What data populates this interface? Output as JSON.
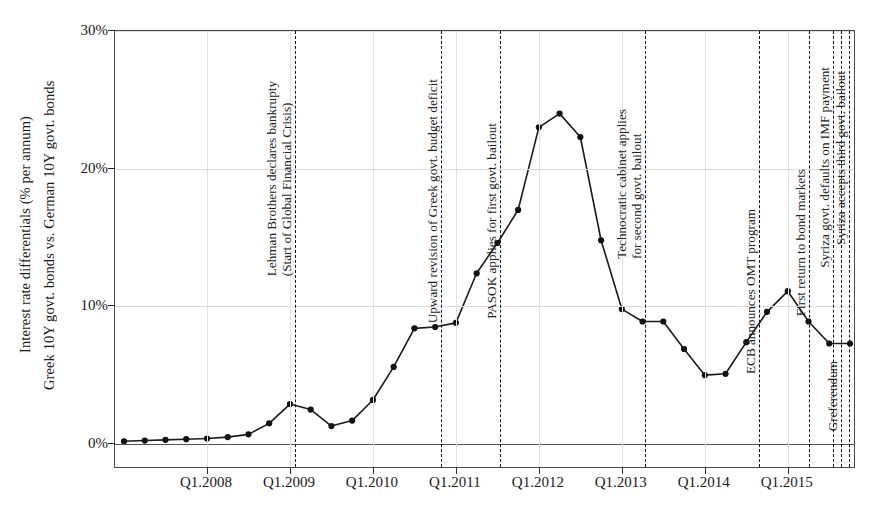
{
  "axis": {
    "y_title_line1": "Interest rate differentials (% per annum)",
    "y_title_line2": "Greek 10Y govt. bonds vs. German 10Y govt. bonds",
    "y_ticks": [
      "0%",
      "10%",
      "20%",
      "30%"
    ],
    "x_ticks": [
      "Q1.2008",
      "Q1.2009",
      "Q1.2010",
      "Q1.2011",
      "Q1.2012",
      "Q1.2013",
      "Q1.2014",
      "Q1.2015"
    ]
  },
  "events": [
    {
      "id": "lehman",
      "label_line1": "Lehman Brothers declares bankrupty",
      "label_line2": "(Start of Global Financial Crisis)",
      "x_pct": 24.3
    },
    {
      "id": "deficit",
      "label_line1": "Upward revision of Greek govt. budget deficit",
      "label_line2": "",
      "x_pct": 44.0
    },
    {
      "id": "pasok",
      "label_line1": "PASOK applies for first govt. bailout",
      "label_line2": "",
      "x_pct": 52.0
    },
    {
      "id": "technocratic",
      "label_line1": "Technocratic cabinet applies",
      "label_line2": "for second govt. bailout",
      "x_pct": 71.5
    },
    {
      "id": "omt",
      "label_line1": "ECB announces OMT program",
      "label_line2": "",
      "x_pct": 86.9
    },
    {
      "id": "bondmarkets",
      "label_line1": "First return to bond markets",
      "label_line2": "",
      "x_pct": 93.7
    },
    {
      "id": "imfdefault",
      "label_line1": "Syriza govt. defaults on IMF payment",
      "label_line2": "",
      "x_pct": 96.9
    },
    {
      "id": "greferendum",
      "label_line1": "Greferendum",
      "label_line2": "",
      "x_pct": 98.0
    },
    {
      "id": "thirdbailout",
      "label_line1": "Syriza accepts third govt. bailout",
      "label_line2": "",
      "x_pct": 99.0
    }
  ],
  "colors": {
    "line": "#1a1a1a",
    "marker": "#111111",
    "grid": "#dcdcdc",
    "frame": "#4a4a4a",
    "event_line": "#111111"
  },
  "chart_data": {
    "type": "line",
    "title": "",
    "xlabel": "",
    "ylabel": "Interest rate differentials (% per annum) Greek 10Y govt. bonds vs. German 10Y govt. bonds",
    "ylim": [
      0,
      30
    ],
    "ytick_values": [
      0,
      10,
      20,
      30
    ],
    "grid": true,
    "legend": "none",
    "x": [
      "Q1.2007",
      "Q2.2007",
      "Q3.2007",
      "Q4.2007",
      "Q1.2008",
      "Q2.2008",
      "Q3.2008",
      "Q4.2008",
      "Q1.2009",
      "Q2.2009",
      "Q3.2009",
      "Q4.2009",
      "Q1.2010",
      "Q2.2010",
      "Q3.2010",
      "Q4.2010",
      "Q1.2011",
      "Q2.2011",
      "Q3.2011",
      "Q4.2011",
      "Q1.2012",
      "Q2.2012",
      "Q3.2012",
      "Q4.2012",
      "Q1.2013",
      "Q2.2013",
      "Q3.2013",
      "Q4.2013",
      "Q1.2014",
      "Q2.2014",
      "Q3.2014",
      "Q4.2014",
      "Q1.2015",
      "Q2.2015",
      "Q3.2015",
      "Q4.2015"
    ],
    "values": [
      0.2,
      0.25,
      0.3,
      0.35,
      0.4,
      0.5,
      0.7,
      1.5,
      2.9,
      2.5,
      1.3,
      1.7,
      3.2,
      5.6,
      8.4,
      8.5,
      8.8,
      12.4,
      14.6,
      17.0,
      23.0,
      24.0,
      22.3,
      14.8,
      9.8,
      8.9,
      8.9,
      6.9,
      5.0,
      5.1,
      7.4,
      9.6,
      11.1,
      8.9,
      7.3,
      7.3
    ],
    "series": [
      {
        "name": "Greek 10Y vs German 10Y spread",
        "values": [
          0.2,
          0.25,
          0.3,
          0.35,
          0.4,
          0.5,
          0.7,
          1.5,
          2.9,
          2.5,
          1.3,
          1.7,
          3.2,
          5.6,
          8.4,
          8.5,
          8.8,
          12.4,
          14.6,
          17.0,
          23.0,
          24.0,
          22.3,
          14.8,
          9.8,
          8.9,
          8.9,
          6.9,
          5.0,
          5.1,
          7.4,
          9.6,
          11.1,
          8.9,
          7.3,
          7.3
        ]
      }
    ],
    "annotations": [
      {
        "label": "Lehman Brothers declares bankrupty (Start of Global Financial Crisis)",
        "at": "Q3.2008"
      },
      {
        "label": "Upward revision of Greek govt. budget deficit",
        "at": "Q4.2009"
      },
      {
        "label": "PASOK applies for first govt. bailout",
        "at": "Q2.2010"
      },
      {
        "label": "Technocratic cabinet applies for second govt. bailout",
        "at": "Q1.2012"
      },
      {
        "label": "ECB announces OMT program",
        "at": "Q3.2012"
      },
      {
        "label": "First return to bond markets",
        "at": "Q2.2014"
      },
      {
        "label": "Syriza govt. defaults on IMF payment",
        "at": "Q2.2015"
      },
      {
        "label": "Greferendum",
        "at": "Q3.2015"
      },
      {
        "label": "Syriza accepts third govt. bailout",
        "at": "Q3.2015"
      }
    ]
  }
}
